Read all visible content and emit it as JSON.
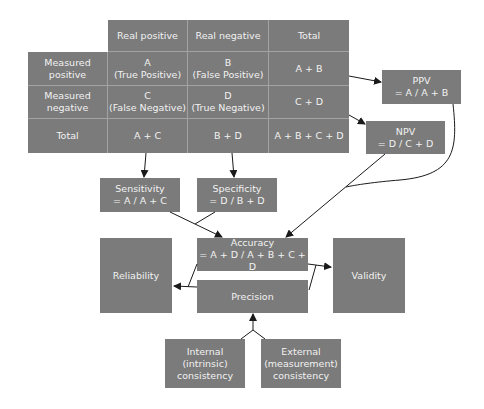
{
  "table": {
    "col_headers": [
      "Real positive",
      "Real negative",
      "Total"
    ],
    "rows": [
      {
        "label": [
          "Measured",
          "positive"
        ],
        "cells": [
          [
            "A",
            "(True Positive)"
          ],
          [
            "B",
            "(False Positive)"
          ],
          [
            "A + B"
          ]
        ]
      },
      {
        "label": [
          "Measured",
          "negative"
        ],
        "cells": [
          [
            "C",
            "(False Negative)"
          ],
          [
            "D",
            "(True Negative)"
          ],
          [
            "C + D"
          ]
        ]
      },
      {
        "label": [
          "Total"
        ],
        "cells": [
          [
            "A + C"
          ],
          [
            "B + D"
          ],
          [
            "A + B + C + D"
          ]
        ]
      }
    ]
  },
  "boxes": {
    "ppv": {
      "title": "PPV",
      "formula": "= A / A + B"
    },
    "npv": {
      "title": "NPV",
      "formula": "= D / C + D"
    },
    "sensitivity": {
      "title": "Sensitivity",
      "formula": "= A / A + C"
    },
    "specificity": {
      "title": "Specificity",
      "formula": "= D / B + D"
    },
    "accuracy": {
      "title": "Accuracy",
      "formula": "= A + D / A + B + C + D"
    },
    "precision": {
      "title": "Precision"
    },
    "reliability": {
      "title": "Reliability"
    },
    "validity": {
      "title": "Validity"
    },
    "internal": {
      "lines": [
        "Internal",
        "(intrinsic)",
        "consistency"
      ]
    },
    "external": {
      "lines": [
        "External",
        "(measurement)",
        "consistency"
      ]
    }
  },
  "colors": {
    "box_fill": "#7b7b7b",
    "grid_line": "#a3a3a3",
    "text": "#f2f2f2",
    "arrow": "#1a1a1a"
  }
}
